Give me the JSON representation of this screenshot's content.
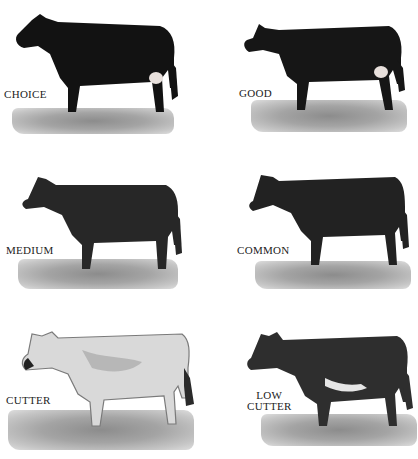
{
  "figure": {
    "panels": [
      {
        "grade": "CHOICE",
        "coat": "#121212"
      },
      {
        "grade": "GOOD",
        "coat": "#161616"
      },
      {
        "grade": "MEDIUM",
        "coat": "#272727"
      },
      {
        "grade": "COMMON",
        "coat": "#222222"
      },
      {
        "grade": "CUTTER",
        "coat": "#d9d9d9"
      },
      {
        "grade": "LOW CUTTER",
        "grade_lines": [
          "LOW",
          "CUTTER"
        ],
        "coat": "#2e2e2e"
      }
    ]
  }
}
